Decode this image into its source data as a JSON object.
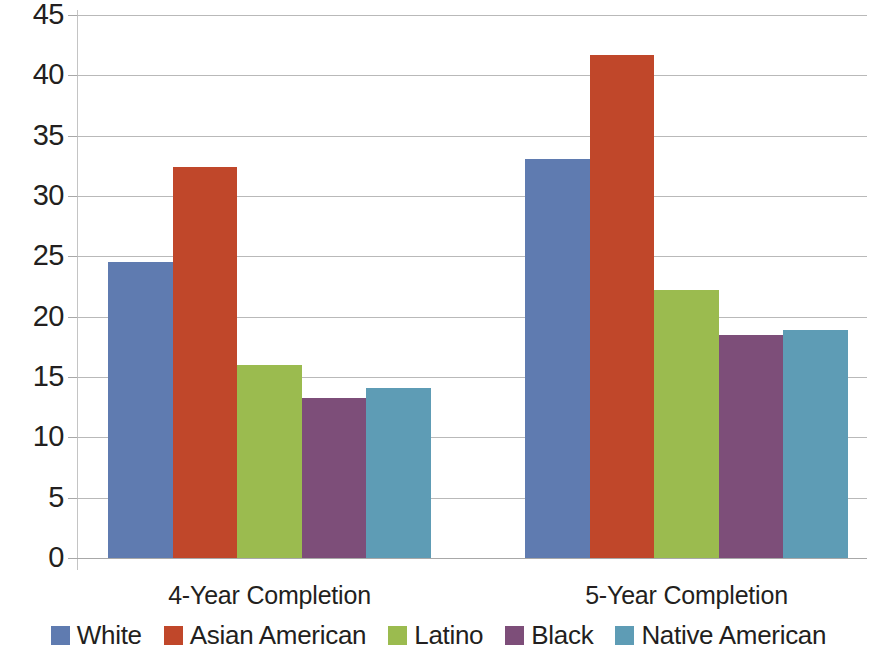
{
  "chart_data": {
    "type": "bar",
    "title": "",
    "subtitle": "",
    "xlabel": "",
    "ylabel": "",
    "categories": [
      "4-Year Completion",
      "5-Year Completion"
    ],
    "series": [
      {
        "name": "White",
        "color": "#5f7bb0",
        "values": [
          24.5,
          33.1
        ]
      },
      {
        "name": "Asian American",
        "color": "#c0472a",
        "values": [
          32.4,
          41.7
        ]
      },
      {
        "name": "Latino",
        "color": "#9bbb4f",
        "values": [
          16.0,
          22.2
        ]
      },
      {
        "name": "Black",
        "color": "#7d4e79",
        "values": [
          13.3,
          18.5
        ]
      },
      {
        "name": "Native American",
        "color": "#5e9cb5",
        "values": [
          14.1,
          18.9
        ]
      }
    ],
    "ylim": [
      0,
      45
    ],
    "y_ticks": [
      0,
      5,
      10,
      15,
      20,
      25,
      30,
      35,
      40,
      45
    ],
    "y_tick_labels": [
      "0",
      "5",
      "10",
      "15",
      "20",
      "25",
      "30",
      "35",
      "40",
      "45"
    ],
    "grid": true,
    "grid_axis": "y",
    "legend_position": "bottom",
    "legend_entries": [
      "White",
      "Asian American",
      "Latino",
      "Black",
      "Native American"
    ],
    "bar_mode": "grouped",
    "annotations": []
  }
}
